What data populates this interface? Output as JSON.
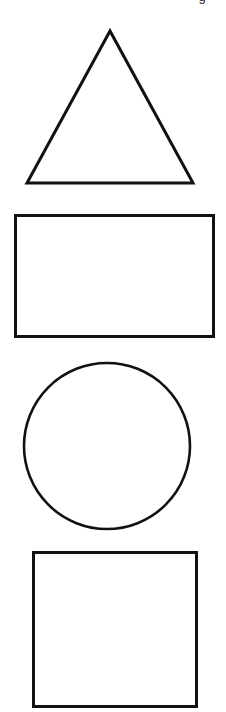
{
  "page": {
    "background_color": "#ffffff",
    "width": 226,
    "height": 712,
    "clipped_header_text": "g"
  },
  "shapes": [
    {
      "name": "triangle",
      "label": "Triangle",
      "stroke_color": "#111111",
      "fill": "none",
      "stroke_width": 3,
      "apex_x": 110,
      "apex_y": 31,
      "base_left_x": 27,
      "base_right_x": 193,
      "base_y": 183
    },
    {
      "name": "rectangle",
      "label": "Rectangle",
      "stroke_color": "#111111",
      "fill": "none",
      "stroke_width": 3,
      "x": 14,
      "y": 214,
      "width": 198,
      "height": 121
    },
    {
      "name": "circle",
      "label": "Circle",
      "stroke_color": "#111111",
      "fill": "none",
      "stroke_width": 2.6,
      "center_x": 107,
      "center_y": 446,
      "radius": 83
    },
    {
      "name": "square",
      "label": "Square",
      "stroke_color": "#111111",
      "fill": "none",
      "stroke_width": 3,
      "x": 33,
      "y": 552,
      "width": 163,
      "height": 154
    }
  ]
}
